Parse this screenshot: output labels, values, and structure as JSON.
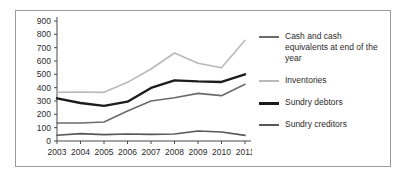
{
  "chart_data": {
    "type": "line",
    "title": "",
    "xlabel": "",
    "ylabel": "",
    "categories": [
      "2003",
      "2004",
      "2005",
      "2006",
      "2007",
      "2008",
      "2009",
      "2010",
      "2011"
    ],
    "ylim": [
      0,
      900
    ],
    "y_ticks": [
      0,
      100,
      200,
      300,
      400,
      500,
      600,
      700,
      800,
      900
    ],
    "grid": false,
    "legend_position": "right",
    "series": [
      {
        "name": "Cash and cash equivalents at end of the year",
        "color": "#6b6b6b",
        "width": 1.6,
        "values": [
          135,
          135,
          143,
          225,
          300,
          325,
          357,
          340,
          425
        ]
      },
      {
        "name": "Inventories",
        "color": "#b9b9b9",
        "width": 1.6,
        "values": [
          365,
          368,
          365,
          440,
          540,
          660,
          583,
          550,
          755
        ]
      },
      {
        "name": "Sundry debtors",
        "color": "#1c1c1c",
        "width": 2.4,
        "values": [
          320,
          285,
          263,
          295,
          398,
          455,
          447,
          443,
          500
        ]
      },
      {
        "name": "Sundry creditors",
        "color": "#575757",
        "width": 1.6,
        "values": [
          43,
          55,
          48,
          53,
          50,
          52,
          75,
          68,
          42
        ]
      }
    ]
  },
  "legend": {
    "entries": [
      {
        "label": "Cash and cash equivalents at end of the year",
        "color": "#6b6b6b",
        "thickness": "2px"
      },
      {
        "label": "Inventories",
        "color": "#b9b9b9",
        "thickness": "2px"
      },
      {
        "label": "Sundry debtors",
        "color": "#1c1c1c",
        "thickness": "3px"
      },
      {
        "label": "Sundry creditors",
        "color": "#575757",
        "thickness": "2px"
      }
    ]
  },
  "axis": {
    "y_labels": [
      "900",
      "800",
      "700",
      "600",
      "500",
      "400",
      "300",
      "200",
      "100",
      "0"
    ],
    "x_labels": [
      "2003",
      "2004",
      "2005",
      "2006",
      "2007",
      "2008",
      "2009",
      "2010",
      "2011"
    ]
  }
}
